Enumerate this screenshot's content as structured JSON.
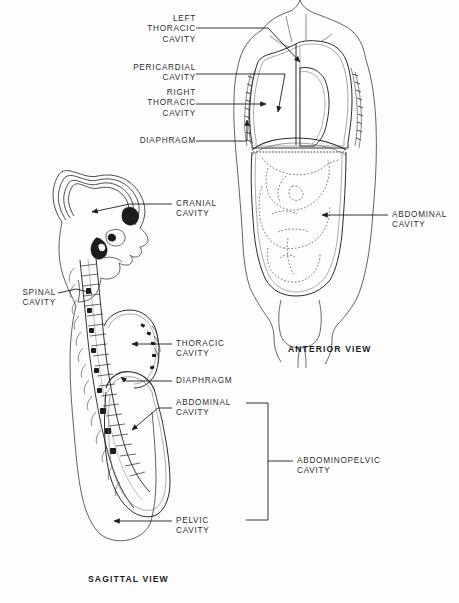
{
  "figure": {
    "background_color": "#fdfdfd",
    "ink_color": "#2e2e2e"
  },
  "anterior": {
    "caption": "ANTERIOR VIEW",
    "labels": {
      "left_thoracic": "LEFT\nTHORACIC\nCAVITY",
      "pericardial": "PERICARDIAL\nCAVITY",
      "right_thoracic": "RIGHT\nTHORACIC\nCAVITY",
      "diaphragm": "DIAPHRAGM",
      "abdominal": "ABDOMINAL\nCAVITY"
    }
  },
  "sagittal": {
    "caption": "SAGITTAL VIEW",
    "labels": {
      "cranial": "CRANIAL\nCAVITY",
      "spinal": "SPINAL\nCAVITY",
      "thoracic": "THORACIC\nCAVITY",
      "diaphragm": "DIAPHRAGM",
      "abdominal": "ABDOMINAL\nCAVITY",
      "pelvic": "PELVIC\nCAVITY",
      "abdominopelvic": "ABDOMINOPELVIC\nCAVITY"
    }
  }
}
